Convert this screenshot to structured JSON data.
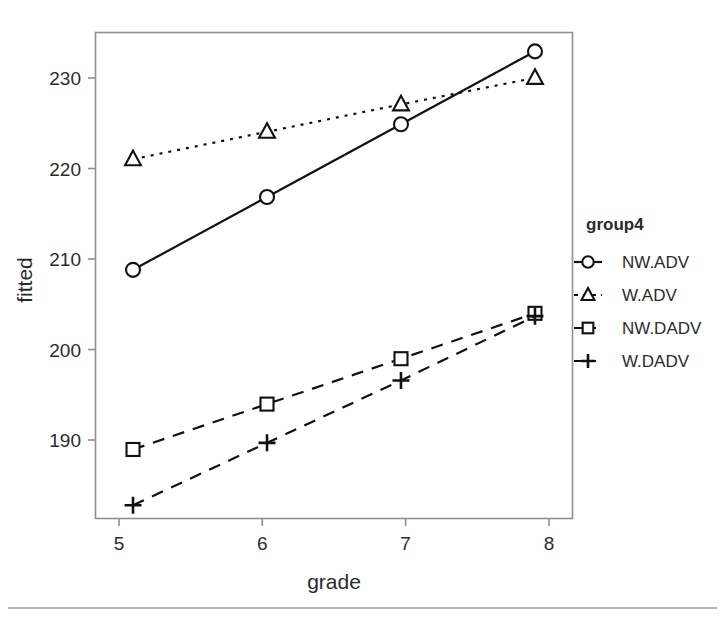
{
  "chart_data": {
    "type": "line",
    "title": "",
    "xlabel": "grade",
    "ylabel": "fitted",
    "x": [
      5,
      6,
      7,
      8
    ],
    "xticklabels": [
      "5",
      "6",
      "7",
      "8"
    ],
    "yticks": [
      190,
      200,
      210,
      220,
      230
    ],
    "yticklabels": [
      "190",
      "200",
      "210",
      "220",
      "230"
    ],
    "xlim": [
      4.72,
      8.28
    ],
    "ylim": [
      183.2,
      234.6
    ],
    "grid": false,
    "legend_position": "right",
    "legend_title": "group4",
    "series": [
      {
        "name": "NW.ADV",
        "marker": "circle",
        "linestyle": "solid",
        "values": [
          209.5,
          217.2,
          224.9,
          232.6
        ]
      },
      {
        "name": "W.ADV",
        "marker": "triangle",
        "linestyle": "dotted",
        "values": [
          221.2,
          224.1,
          227.0,
          229.8
        ]
      },
      {
        "name": "NW.DADV",
        "marker": "square",
        "linestyle": "dashed",
        "values": [
          190.5,
          195.3,
          200.1,
          204.9
        ]
      },
      {
        "name": "W.DADV",
        "marker": "plus",
        "linestyle": "dashed",
        "values": [
          184.6,
          191.2,
          197.8,
          204.6
        ]
      }
    ]
  },
  "axes": {
    "x_title": "grade",
    "y_title": "fitted",
    "x_tick_labels": [
      "5",
      "6",
      "7",
      "8"
    ],
    "y_tick_labels": [
      "190",
      "200",
      "210",
      "220",
      "230"
    ]
  },
  "legend": {
    "title": "group4",
    "entries": [
      {
        "label": "NW.ADV",
        "marker": "circle-marker-icon",
        "linestyle": "solid"
      },
      {
        "label": "W.ADV",
        "marker": "triangle-marker-icon",
        "linestyle": "dotted"
      },
      {
        "label": "NW.DADV",
        "marker": "square-marker-icon",
        "linestyle": "dashed"
      },
      {
        "label": "W.DADV",
        "marker": "plus-marker-icon",
        "linestyle": "dashed"
      }
    ]
  },
  "colors": {
    "ink": "#111111",
    "frame": "#8f8f8f",
    "text": "#2b2b2b",
    "background": "#ffffff"
  }
}
